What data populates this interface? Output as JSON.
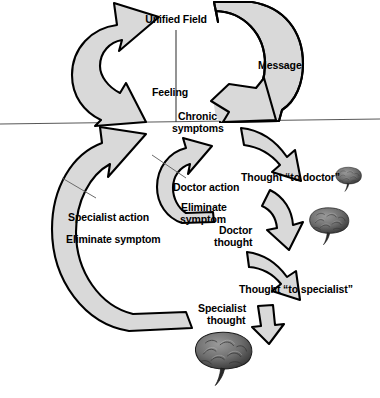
{
  "diagram": {
    "colors": {
      "arrow_fill": "#d9d9d9",
      "arrow_stroke": "#000000",
      "axis_line": "#555555",
      "leader_line": "#6b6b6b",
      "text": "#000000",
      "background": "#ffffff",
      "brain_dark": "#3a3a3a",
      "brain_mid": "#7a7a7a",
      "brain_light": "#a8a8a8"
    },
    "labels": {
      "unified_field": "Unified Field",
      "message": "Message",
      "feeling": "Feeling",
      "chronic_symptoms_line1": "Chronic",
      "chronic_symptoms_line2": "symptoms",
      "thought_to_doctor": "Thought “to doctor”",
      "doctor_action": "Doctor action",
      "eliminate_symptom_line1": "Eliminate",
      "eliminate_symptom_line2": "symptom",
      "doctor_thought_line1": "Doctor",
      "doctor_thought_line2": "thought",
      "thought_to_specialist": "Thought “to specialist”",
      "specialist_action": "Specialist action",
      "eliminate_symptom": "Eliminate symptom",
      "specialist_thought_line1": "Specialist",
      "specialist_thought_line2": "thought"
    },
    "arrows": [
      {
        "name": "unified-field-return-arrow",
        "shape": "c-arc-open-right",
        "head": "up-right"
      },
      {
        "name": "message-arrow",
        "shape": "d-arc-open-left",
        "head": "down-left"
      },
      {
        "name": "thought-to-doctor-arrow",
        "shape": "curved-down-right",
        "head": "down-right"
      },
      {
        "name": "doctor-thought-arrow",
        "shape": "curved-down",
        "head": "down"
      },
      {
        "name": "thought-to-specialist-arrow",
        "shape": "curved-down-right",
        "head": "down-right"
      },
      {
        "name": "specialist-thought-arrow",
        "shape": "short-down",
        "head": "down"
      },
      {
        "name": "doctor-action-arrow",
        "shape": "c-arc-open-right",
        "head": "up-right"
      },
      {
        "name": "specialist-action-arrow",
        "shape": "large-c-arc-open-right",
        "head": "up-right"
      }
    ],
    "brains": [
      {
        "name": "brain-small",
        "size": "small"
      },
      {
        "name": "brain-medium",
        "size": "medium"
      },
      {
        "name": "brain-large",
        "size": "large"
      }
    ],
    "axes": {
      "horizontal_line": "unified-field-boundary",
      "vertical_line": "unified-field-axis"
    }
  }
}
